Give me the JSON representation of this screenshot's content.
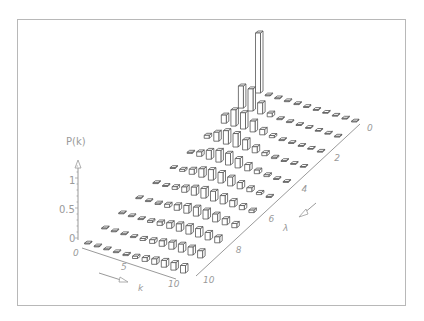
{
  "chart_data": {
    "type": "bar3d",
    "title": "",
    "zlabel": "P(k)",
    "xlabel": "k",
    "ylabel": "λ",
    "z_ticks": [
      "0",
      "0.5",
      "1"
    ],
    "k_ticks": [
      "0",
      "5",
      "10"
    ],
    "lambda_ticks": [
      "0",
      "2",
      "4",
      "6",
      "8",
      "10"
    ],
    "k": [
      0,
      1,
      2,
      3,
      4,
      5,
      6,
      7,
      8,
      9,
      10
    ],
    "lambda": [
      0,
      1,
      2,
      3,
      4,
      5,
      6,
      7,
      8,
      9,
      10
    ],
    "series": [
      {
        "name": "λ=0",
        "values": [
          1.0,
          0,
          0,
          0,
          0,
          0,
          0,
          0,
          0,
          0,
          0
        ]
      },
      {
        "name": "λ=1",
        "values": [
          0.368,
          0.368,
          0.184,
          0.061,
          0.015,
          0.003,
          0.001,
          0,
          0,
          0,
          0
        ]
      },
      {
        "name": "λ=2",
        "values": [
          0.135,
          0.271,
          0.271,
          0.18,
          0.09,
          0.036,
          0.012,
          0.003,
          0.001,
          0,
          0
        ]
      },
      {
        "name": "λ=3",
        "values": [
          0.05,
          0.149,
          0.224,
          0.224,
          0.168,
          0.101,
          0.05,
          0.022,
          0.008,
          0.003,
          0.001
        ]
      },
      {
        "name": "λ=4",
        "values": [
          0.018,
          0.073,
          0.147,
          0.195,
          0.195,
          0.156,
          0.104,
          0.06,
          0.03,
          0.013,
          0.005
        ]
      },
      {
        "name": "λ=5",
        "values": [
          0.007,
          0.034,
          0.084,
          0.14,
          0.175,
          0.175,
          0.146,
          0.104,
          0.065,
          0.036,
          0.018
        ]
      },
      {
        "name": "λ=6",
        "values": [
          0.002,
          0.015,
          0.045,
          0.089,
          0.134,
          0.161,
          0.161,
          0.138,
          0.103,
          0.069,
          0.041
        ]
      },
      {
        "name": "λ=7",
        "values": [
          0.001,
          0.006,
          0.022,
          0.052,
          0.091,
          0.128,
          0.149,
          0.149,
          0.13,
          0.101,
          0.071
        ]
      },
      {
        "name": "λ=8",
        "values": [
          0.0,
          0.003,
          0.011,
          0.029,
          0.057,
          0.092,
          0.122,
          0.14,
          0.14,
          0.124,
          0.099
        ]
      },
      {
        "name": "λ=9",
        "values": [
          0.0,
          0.001,
          0.005,
          0.015,
          0.034,
          0.061,
          0.091,
          0.117,
          0.132,
          0.132,
          0.119
        ]
      },
      {
        "name": "λ=10",
        "values": [
          0.0,
          0.0,
          0.002,
          0.008,
          0.019,
          0.038,
          0.063,
          0.09,
          0.113,
          0.125,
          0.125
        ]
      }
    ],
    "zlim": [
      0,
      1.2
    ],
    "grid": false,
    "legend": "none"
  },
  "colors": {
    "bar_fill": "#ffffff",
    "bar_stroke": "#555555",
    "axis": "#9a9a9a",
    "frame": "#b8b8b8"
  }
}
